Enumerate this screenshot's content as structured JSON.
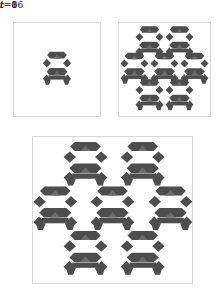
{
  "figure": {
    "kind": "self-replicating-loop-automaton-time-series",
    "background_color": "#ffffff",
    "panel_border_color": "#d8d8d8",
    "cell_color": "#4d4d4d",
    "cell_color_light": "#6b6b6b",
    "label_color": "#1a1a1a"
  },
  "panels": [
    {
      "id": "t0",
      "label_var": "t",
      "label_eq": "=",
      "label_value": "0",
      "label": "t = 0",
      "copies": 1
    },
    {
      "id": "t8",
      "label_var": "t",
      "label_eq": "=",
      "label_value": "8",
      "label": "t = 8",
      "copies": 7
    },
    {
      "id": "t16",
      "label_var": "t",
      "label_eq": "=",
      "label_value": "16",
      "label": "t = 16",
      "copies": 7
    }
  ],
  "chart_data": {
    "type": "scatter",
    "title": "",
    "xlabel": "",
    "ylabel": "",
    "panels": [
      {
        "label": "t = 0",
        "time": 0,
        "copy_count": 1,
        "layout": "single-centered",
        "motif_positions": [
          {
            "x": 0.5,
            "y": 0.5
          }
        ]
      },
      {
        "label": "t = 8",
        "time": 8,
        "copy_count": 7,
        "layout": "hexagonal-2-3-2-overlapping",
        "motif_positions": [
          {
            "x": 0.335,
            "y": 0.215
          },
          {
            "x": 0.665,
            "y": 0.215
          },
          {
            "x": 0.17,
            "y": 0.5
          },
          {
            "x": 0.5,
            "y": 0.5
          },
          {
            "x": 0.83,
            "y": 0.5
          },
          {
            "x": 0.335,
            "y": 0.785
          },
          {
            "x": 0.665,
            "y": 0.785
          }
        ]
      },
      {
        "label": "t = 16",
        "time": 16,
        "copy_count": 7,
        "layout": "hexagonal-2-3-2-separated",
        "motif_positions": [
          {
            "x": 0.33,
            "y": 0.195
          },
          {
            "x": 0.69,
            "y": 0.195
          },
          {
            "x": 0.14,
            "y": 0.5
          },
          {
            "x": 0.5,
            "y": 0.5
          },
          {
            "x": 0.865,
            "y": 0.5
          },
          {
            "x": 0.33,
            "y": 0.805
          },
          {
            "x": 0.69,
            "y": 0.805
          }
        ]
      }
    ]
  }
}
